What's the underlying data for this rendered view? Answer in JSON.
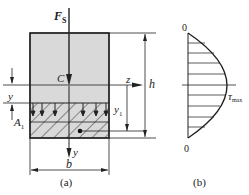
{
  "figure_a": {
    "force_label": "F",
    "force_sub": "S",
    "centroid_label": "C",
    "z_axis_label": "z",
    "y_axis_label": "y",
    "y_dim_label": "y",
    "area_label": "A",
    "area_sub": "1",
    "y1_label": "y",
    "y1_sub": "1",
    "height_label": "h",
    "width_label": "b",
    "caption": "(a)"
  },
  "figure_b": {
    "top_zero": "0",
    "bottom_zero": "0",
    "tau_label": "τ",
    "tau_sub": "max",
    "caption": "(b)"
  },
  "colors": {
    "section_fill": "#d9d9d9",
    "line": "#222222"
  }
}
